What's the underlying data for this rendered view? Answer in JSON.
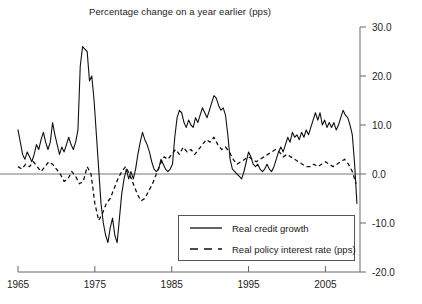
{
  "chart_data": {
    "type": "line",
    "title": "Percentage change on a year earlier (pps)",
    "xlabel": "",
    "ylabel": "",
    "xlim": [
      1965,
      2009.5
    ],
    "ylim": [
      -20.0,
      30.0
    ],
    "grid": false,
    "legend_position": "bottom-right",
    "y_ticks": [
      "30.0",
      "20.0",
      "10.0",
      "0.0",
      "-10.0",
      "-20.0"
    ],
    "y_tick_values": [
      30.0,
      20.0,
      10.0,
      0.0,
      -10.0,
      -20.0
    ],
    "x_ticks": [
      "1965",
      "1975",
      "1985",
      "1995",
      "2005"
    ],
    "x_tick_values": [
      1965,
      1975,
      1985,
      1995,
      2005
    ],
    "zero_line": 0.0,
    "series": [
      {
        "name": "Real credit growth",
        "style": "solid",
        "color": "#111111",
        "x": [
          1965.0,
          1965.3,
          1965.6,
          1965.9,
          1966.2,
          1966.5,
          1966.8,
          1967.1,
          1967.4,
          1967.7,
          1968.0,
          1968.3,
          1968.6,
          1968.9,
          1969.2,
          1969.5,
          1969.8,
          1970.1,
          1970.4,
          1970.7,
          1971.0,
          1971.3,
          1971.6,
          1971.9,
          1972.2,
          1972.5,
          1972.8,
          1973.1,
          1973.4,
          1973.7,
          1974.0,
          1974.3,
          1974.6,
          1974.9,
          1975.2,
          1975.5,
          1975.8,
          1976.1,
          1976.4,
          1976.7,
          1977.0,
          1977.3,
          1977.6,
          1977.9,
          1978.2,
          1978.5,
          1978.8,
          1979.1,
          1979.4,
          1979.7,
          1980.0,
          1980.3,
          1980.6,
          1980.9,
          1981.2,
          1981.5,
          1981.8,
          1982.1,
          1982.4,
          1982.7,
          1983.0,
          1983.3,
          1983.6,
          1983.9,
          1984.2,
          1984.5,
          1984.8,
          1985.1,
          1985.4,
          1985.7,
          1986.0,
          1986.3,
          1986.6,
          1986.9,
          1987.2,
          1987.5,
          1987.8,
          1988.1,
          1988.4,
          1988.7,
          1989.0,
          1989.3,
          1989.6,
          1989.9,
          1990.2,
          1990.5,
          1990.8,
          1991.1,
          1991.4,
          1991.7,
          1992.0,
          1992.3,
          1992.6,
          1992.9,
          1993.2,
          1993.5,
          1993.8,
          1994.1,
          1994.4,
          1994.7,
          1995.0,
          1995.3,
          1995.6,
          1995.9,
          1996.2,
          1996.5,
          1996.8,
          1997.1,
          1997.4,
          1997.7,
          1998.0,
          1998.3,
          1998.6,
          1998.9,
          1999.2,
          1999.5,
          1999.8,
          2000.1,
          2000.4,
          2000.7,
          2001.0,
          2001.3,
          2001.6,
          2001.9,
          2002.2,
          2002.5,
          2002.8,
          2003.1,
          2003.4,
          2003.7,
          2004.0,
          2004.3,
          2004.6,
          2004.9,
          2005.2,
          2005.5,
          2005.8,
          2006.1,
          2006.4,
          2006.7,
          2007.0,
          2007.3,
          2007.6,
          2007.9,
          2008.2,
          2008.5,
          2008.8,
          2009.1
        ],
        "y": [
          9.0,
          6.5,
          4.0,
          3.0,
          4.5,
          3.5,
          2.5,
          4.0,
          6.0,
          5.0,
          7.0,
          8.5,
          6.5,
          5.0,
          6.5,
          10.5,
          8.0,
          6.0,
          4.0,
          5.5,
          4.5,
          6.0,
          7.5,
          6.0,
          5.0,
          6.5,
          9.0,
          22.0,
          26.0,
          25.5,
          25.0,
          19.0,
          20.0,
          15.0,
          8.0,
          1.0,
          -6.0,
          -10.0,
          -12.5,
          -14.0,
          -11.0,
          -9.0,
          -12.5,
          -14.0,
          -9.0,
          -4.0,
          -1.0,
          1.0,
          -1.0,
          0.5,
          -1.0,
          1.0,
          4.0,
          6.5,
          8.5,
          7.0,
          6.0,
          4.5,
          2.5,
          1.0,
          0.5,
          1.0,
          3.0,
          2.0,
          1.0,
          0.5,
          1.0,
          2.0,
          7.5,
          11.5,
          13.0,
          12.5,
          10.5,
          9.5,
          11.0,
          10.0,
          9.5,
          11.5,
          10.5,
          12.0,
          13.5,
          12.5,
          11.5,
          13.0,
          14.5,
          16.0,
          15.5,
          14.0,
          13.0,
          13.5,
          12.0,
          8.0,
          3.0,
          1.0,
          0.5,
          0.0,
          -0.5,
          -1.0,
          0.5,
          2.5,
          4.5,
          3.5,
          2.0,
          1.5,
          2.0,
          1.0,
          0.5,
          1.0,
          2.0,
          1.0,
          0.5,
          1.5,
          3.0,
          4.5,
          5.5,
          4.5,
          6.0,
          7.5,
          6.5,
          8.5,
          7.5,
          8.0,
          7.0,
          8.5,
          7.5,
          9.0,
          8.0,
          9.5,
          11.0,
          12.5,
          11.0,
          12.5,
          10.0,
          11.0,
          9.5,
          10.5,
          9.5,
          10.5,
          9.0,
          10.0,
          11.5,
          13.0,
          12.0,
          11.5,
          10.0,
          8.0,
          2.0,
          -6.0
        ]
      },
      {
        "name": "Real policy interest rate (pps)",
        "style": "dashed",
        "color": "#111111",
        "x": [
          1965.0,
          1965.5,
          1966.0,
          1966.5,
          1967.0,
          1967.5,
          1968.0,
          1968.5,
          1969.0,
          1969.5,
          1970.0,
          1970.5,
          1971.0,
          1971.5,
          1972.0,
          1972.5,
          1973.0,
          1973.5,
          1974.0,
          1974.5,
          1975.0,
          1975.5,
          1976.0,
          1976.5,
          1977.0,
          1977.5,
          1978.0,
          1978.5,
          1979.0,
          1979.5,
          1980.0,
          1980.5,
          1981.0,
          1981.5,
          1982.0,
          1982.5,
          1983.0,
          1983.5,
          1984.0,
          1984.5,
          1985.0,
          1985.5,
          1986.0,
          1986.5,
          1987.0,
          1987.5,
          1988.0,
          1988.5,
          1989.0,
          1989.5,
          1990.0,
          1990.5,
          1991.0,
          1991.5,
          1992.0,
          1992.5,
          1993.0,
          1993.5,
          1994.0,
          1994.5,
          1995.0,
          1995.5,
          1996.0,
          1996.5,
          1997.0,
          1997.5,
          1998.0,
          1998.5,
          1999.0,
          1999.5,
          2000.0,
          2000.5,
          2001.0,
          2001.5,
          2002.0,
          2002.5,
          2003.0,
          2003.5,
          2004.0,
          2004.5,
          2005.0,
          2005.5,
          2006.0,
          2006.5,
          2007.0,
          2007.5,
          2008.0,
          2008.5,
          2009.0
        ],
        "y": [
          1.5,
          1.0,
          2.0,
          1.5,
          2.5,
          1.5,
          0.5,
          1.5,
          2.5,
          2.0,
          1.0,
          0.0,
          -1.5,
          -1.0,
          0.5,
          -0.5,
          -2.0,
          -1.5,
          1.5,
          0.0,
          -6.0,
          -9.5,
          -8.0,
          -6.0,
          -5.0,
          -3.0,
          -1.0,
          0.5,
          1.5,
          0.0,
          -2.0,
          -4.0,
          -5.5,
          -5.0,
          -3.5,
          -2.0,
          0.0,
          2.0,
          3.5,
          3.0,
          4.0,
          5.0,
          4.0,
          5.5,
          4.5,
          5.0,
          4.0,
          5.0,
          6.0,
          7.0,
          6.5,
          7.5,
          6.0,
          5.0,
          5.5,
          4.5,
          3.0,
          2.0,
          2.5,
          3.0,
          3.5,
          3.0,
          2.5,
          3.0,
          3.5,
          4.0,
          4.5,
          5.0,
          4.5,
          3.5,
          4.0,
          3.5,
          3.0,
          2.5,
          2.0,
          1.5,
          1.5,
          2.0,
          1.5,
          2.0,
          2.5,
          2.0,
          1.5,
          2.0,
          2.5,
          3.0,
          2.0,
          0.5,
          -2.0
        ]
      }
    ]
  },
  "legend": {
    "items": [
      {
        "label": "Real credit growth",
        "style": "solid"
      },
      {
        "label": "Real policy interest rate (pps)",
        "style": "dashed"
      }
    ]
  }
}
